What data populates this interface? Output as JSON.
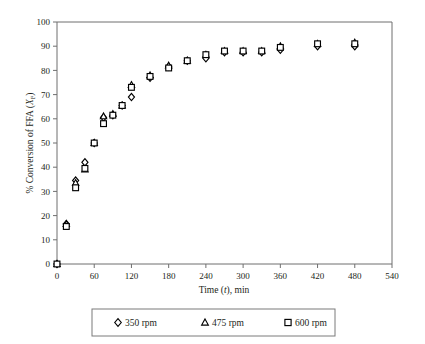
{
  "chart_data": {
    "type": "scatter",
    "title": "",
    "xlabel": "Time (t), min",
    "xlabel_parts": {
      "pre": "Time (",
      "italic": "t",
      "post": "), min"
    },
    "ylabel": "% Conversion of FFA (XF)",
    "ylabel_parts": {
      "pre": "% Conversion of FFA (",
      "italic": "X",
      "sub": "F",
      "post": ")"
    },
    "xlim": [
      0,
      540
    ],
    "ylim": [
      0,
      100
    ],
    "xticks": [
      0,
      60,
      120,
      180,
      240,
      300,
      360,
      420,
      480,
      540
    ],
    "yticks": [
      0,
      10,
      20,
      30,
      40,
      50,
      60,
      70,
      80,
      90,
      100
    ],
    "xtick_labels": [
      "0",
      "60",
      "120",
      "180",
      "240",
      "300",
      "360",
      "420",
      "480",
      "540"
    ],
    "ytick_labels": [
      "0",
      "10",
      "20",
      "30",
      "40",
      "50",
      "60",
      "70",
      "80",
      "90",
      "100"
    ],
    "grid": false,
    "legend_position": "below",
    "marker_color": "#000000",
    "series": [
      {
        "name": "350 rpm",
        "marker": "diamond",
        "x": [
          0,
          15,
          30,
          45,
          60,
          75,
          90,
          105,
          120,
          150,
          180,
          210,
          240,
          270,
          300,
          330,
          360,
          420,
          480
        ],
        "y": [
          0,
          16.5,
          34.5,
          42,
          50,
          60.5,
          61.5,
          65.5,
          69,
          77,
          81.5,
          84,
          85,
          87.5,
          87.5,
          87.5,
          88.5,
          90,
          90
        ]
      },
      {
        "name": "475 rpm",
        "marker": "triangle",
        "x": [
          0,
          15,
          30,
          45,
          60,
          75,
          90,
          105,
          120,
          150,
          180,
          210,
          240,
          270,
          300,
          330,
          360,
          420,
          480
        ],
        "y": [
          0,
          16.5,
          33.5,
          39,
          50,
          61,
          62,
          65.5,
          74,
          78,
          82,
          84,
          86.5,
          88,
          88,
          88,
          90,
          91,
          91.5
        ]
      },
      {
        "name": "600 rpm",
        "marker": "square",
        "x": [
          0,
          15,
          30,
          45,
          60,
          75,
          90,
          105,
          120,
          150,
          180,
          210,
          240,
          270,
          300,
          330,
          360,
          420,
          480
        ],
        "y": [
          0,
          15.5,
          31.5,
          39.5,
          50,
          58,
          61.5,
          65.5,
          73,
          77.5,
          81,
          84,
          86.5,
          88,
          88,
          88,
          89.5,
          91,
          91
        ]
      }
    ]
  },
  "legend": {
    "entries": [
      {
        "label": "350 rpm",
        "marker": "diamond"
      },
      {
        "label": "475 rpm",
        "marker": "triangle"
      },
      {
        "label": "600 rpm",
        "marker": "square"
      }
    ]
  }
}
